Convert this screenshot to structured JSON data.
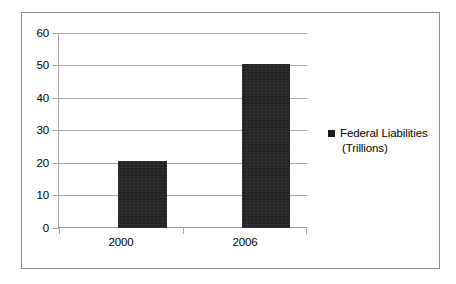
{
  "chart_data": {
    "type": "bar",
    "title": "",
    "subtitle": "",
    "xlabel": "",
    "ylabel": "",
    "categories": [
      "2000",
      "2006"
    ],
    "series": [
      {
        "name": "Federal Liabilities (Trillions)",
        "values": [
          20.5,
          50.5
        ],
        "color": "#232323"
      }
    ],
    "ylim": [
      0,
      60
    ],
    "ytick_values": [
      60,
      50,
      40,
      30,
      20,
      10,
      0
    ],
    "ytick_labels": [
      "60",
      "50",
      "40",
      "30",
      "20",
      "10",
      "0"
    ],
    "grid": true,
    "legend_position": "right",
    "legend_entries": [
      {
        "label_line1": "Federal Liabilities",
        "label_line2": "(Trillions)",
        "marker": "filled-square",
        "color": "#1b1b1b"
      }
    ],
    "colors": {
      "bar": "#232323",
      "gridline": "#a6a6a6",
      "axis": "#a6a6a6",
      "border": "#8d8d8d",
      "background": "#ffffff",
      "text": "#000000"
    }
  }
}
